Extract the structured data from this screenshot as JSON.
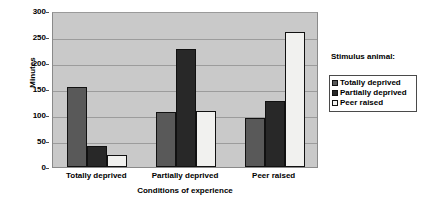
{
  "chart_data": {
    "type": "bar",
    "title": "",
    "xlabel": "Conditions of experience",
    "ylabel": "Minutes",
    "categories": [
      "Totally deprived",
      "Partially deprived",
      "Peer raised"
    ],
    "series": [
      {
        "name": "Totally deprived",
        "values": [
          153,
          105,
          95
        ],
        "color": "#595959"
      },
      {
        "name": "Partially deprived",
        "values": [
          40,
          226,
          127
        ],
        "color": "#282828"
      },
      {
        "name": "Peer raised",
        "values": [
          23,
          107,
          260
        ],
        "color": "#f1f1ef"
      }
    ],
    "ylim": [
      0,
      300
    ],
    "yticks": [
      0,
      50,
      100,
      150,
      200,
      250,
      300
    ],
    "ytick_labels": [
      "0",
      "50",
      "100",
      "150",
      "200",
      "250",
      "300"
    ],
    "grid": true,
    "legend_position": "right",
    "legend_title": "Stimulus animal:",
    "plot_background": "#c9c9c9"
  }
}
